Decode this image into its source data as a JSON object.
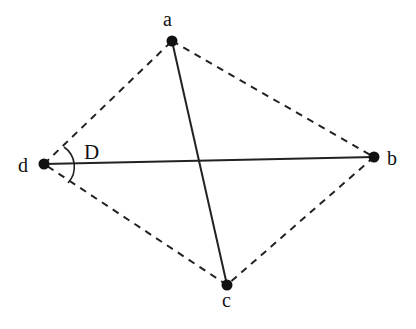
{
  "diagram": {
    "points": [
      {
        "id": "a",
        "label": "a"
      },
      {
        "id": "b",
        "label": "b"
      },
      {
        "id": "c",
        "label": "c"
      },
      {
        "id": "d",
        "label": "d"
      }
    ],
    "solid_edges": [
      [
        "a",
        "c"
      ],
      [
        "d",
        "b"
      ]
    ],
    "dashed_edges": [
      [
        "a",
        "b"
      ],
      [
        "b",
        "c"
      ],
      [
        "c",
        "d"
      ],
      [
        "d",
        "a"
      ]
    ],
    "angle": {
      "vertex": "d",
      "label": "D"
    },
    "colors": {
      "stroke": "#111111",
      "background": "#ffffff"
    }
  }
}
